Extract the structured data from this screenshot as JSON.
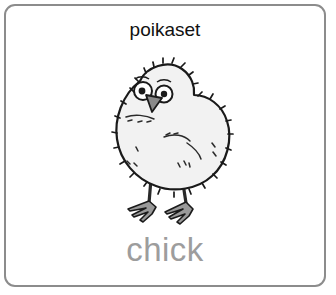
{
  "card": {
    "border_color": "#8c8c8c",
    "background_color": "#ffffff",
    "word_top": "poikaset",
    "word_top_color": "#111111",
    "word_bottom": "chick",
    "word_bottom_color": "#9d9d9d"
  },
  "illustration": {
    "subject": "chick-drawing",
    "description": "black and white line drawing of a fluffy baby chick standing on two legs",
    "body_fill": "#f2f2f2",
    "outline_color": "#1a1a1a",
    "beak_fill": "#8a8a8a",
    "feet_fill": "#9a9a9a",
    "eye_fill": "#ffffff",
    "pupil_fill": "#1a1a1a"
  }
}
